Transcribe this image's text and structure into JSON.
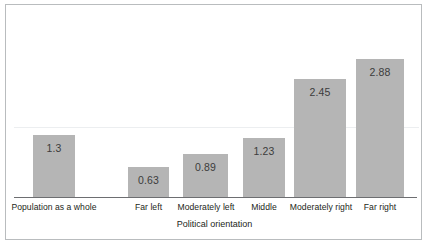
{
  "chart_data": {
    "type": "bar",
    "title": "",
    "subtitle": "",
    "xlabel": "Political orientation",
    "ylabel": "",
    "categories": [
      "Population as a whole",
      "Far left",
      "Moderately left",
      "Middle",
      "Moderately right",
      "Far right"
    ],
    "values": [
      1.3,
      0.63,
      0.89,
      1.23,
      2.45,
      2.88
    ],
    "value_labels": [
      "1.3",
      "0.63",
      "0.89",
      "1.23",
      "2.45",
      "2.88"
    ],
    "ylim": [
      0,
      2.95
    ],
    "grid": "single-faint-horizontal-line",
    "legend": "none",
    "bar_color": "#b5b5b5",
    "axis_color": "#6d6e71",
    "frame_color": "#b9bcbe",
    "gap_after_first_category": true
  },
  "geometry": {
    "baseline_y": 192,
    "pixels_per_unit": 48,
    "gridline_y": 122,
    "bars": [
      {
        "left": 27,
        "width": 42
      },
      {
        "left": 122,
        "width": 41
      },
      {
        "left": 177,
        "width": 45
      },
      {
        "left": 237,
        "width": 42
      },
      {
        "left": 288,
        "width": 52
      },
      {
        "left": 350,
        "width": 48
      }
    ],
    "labels": [
      {
        "left": 5,
        "width": 86
      },
      {
        "left": 117,
        "width": 51
      },
      {
        "left": 166,
        "width": 68
      },
      {
        "left": 229,
        "width": 58
      },
      {
        "left": 281,
        "width": 68
      },
      {
        "left": 348,
        "width": 52
      }
    ]
  }
}
